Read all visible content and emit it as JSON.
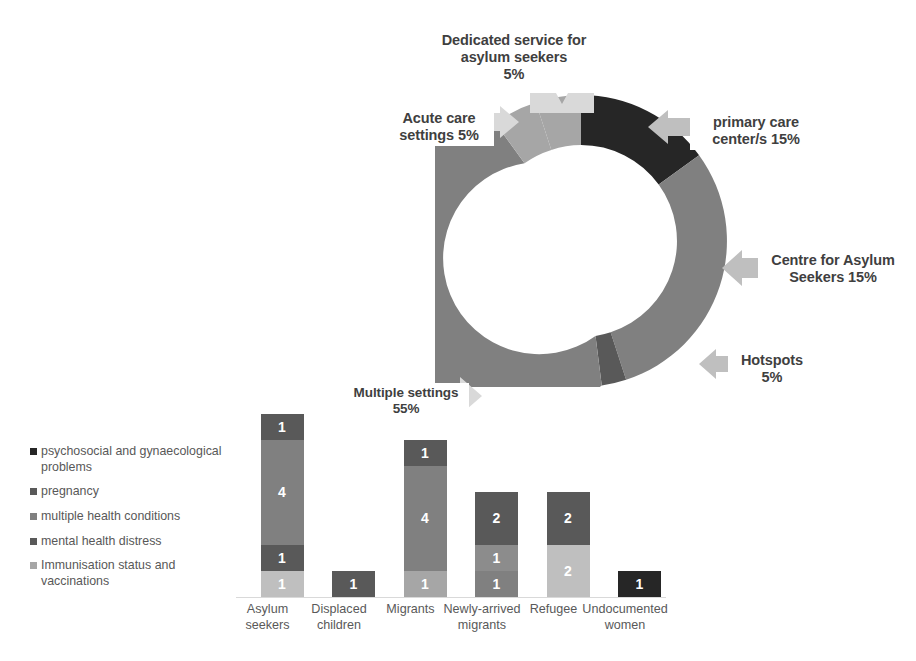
{
  "chart_data": [
    {
      "type": "pie",
      "variant": "doughnut",
      "title": "",
      "legend_position": "none",
      "labels_inline": true,
      "categories": [
        "Dedicated service for asylum seekers",
        "primary care center/s",
        "Centre for Asylum Seekers",
        "Hotspots",
        "Multiple settings",
        "Acute care settings"
      ],
      "values": [
        5,
        15,
        15,
        5,
        55,
        5
      ],
      "value_unit": "%",
      "display_labels": [
        "Dedicated service for asylum seekers 5%",
        "primary care center/s 15%",
        "Centre for Asylum Seekers 15%",
        "Hotspots 5%",
        "Multiple settings 55%",
        "Acute care settings 5%"
      ],
      "colors": [
        "#A6A6A6",
        "#262626",
        "#808080",
        "#595959",
        "#808080",
        "#A6A6A6"
      ]
    },
    {
      "type": "bar",
      "variant": "stacked-column",
      "title": "",
      "xlabel": "",
      "ylabel": "",
      "ylim": [
        0,
        7
      ],
      "grid": false,
      "categories": [
        "Asylum seekers",
        "Displaced children",
        "Migrants",
        "Newly-arrived migrants",
        "Refugee",
        "Undocumented women"
      ],
      "series": [
        {
          "name": "psychosocial and gynaecological problems",
          "color": "#262626",
          "values": [
            0,
            0,
            0,
            0,
            0,
            1
          ]
        },
        {
          "name": "pregnancy",
          "color": "#595959",
          "values": [
            1,
            0,
            1,
            0,
            0,
            0
          ]
        },
        {
          "name": "multiple health conditions",
          "color": "#808080",
          "values": [
            4,
            0,
            4,
            0,
            0,
            0
          ]
        },
        {
          "name": "mental health distress",
          "color": "#595959",
          "values": [
            1,
            1,
            0,
            2,
            2,
            0
          ]
        },
        {
          "name": "Immunisation status and vaccinations",
          "color": "#A6A6A6",
          "values": [
            1,
            0,
            1,
            2,
            2,
            0
          ]
        }
      ],
      "stacks": [
        {
          "category": "Asylum seekers",
          "segments": [
            {
              "label": "1",
              "value": 1,
              "color": "#595959"
            },
            {
              "label": "4",
              "value": 4,
              "color": "#808080"
            },
            {
              "label": "1",
              "value": 1,
              "color": "#595959"
            },
            {
              "label": "1",
              "value": 1,
              "color": "#BFBFBF"
            }
          ]
        },
        {
          "category": "Displaced children",
          "segments": [
            {
              "label": "1",
              "value": 1,
              "color": "#595959"
            }
          ]
        },
        {
          "category": "Migrants",
          "segments": [
            {
              "label": "1",
              "value": 1,
              "color": "#595959"
            },
            {
              "label": "4",
              "value": 4,
              "color": "#808080"
            },
            {
              "label": "1",
              "value": 1,
              "color": "#A6A6A6"
            }
          ]
        },
        {
          "category": "Newly-arrived migrants",
          "segments": [
            {
              "label": "2",
              "value": 2,
              "color": "#595959"
            },
            {
              "label": "1",
              "value": 1,
              "color": "#8C8C8C"
            },
            {
              "label": "1",
              "value": 1,
              "color": "#808080"
            }
          ]
        },
        {
          "category": "Refugee",
          "segments": [
            {
              "label": "2",
              "value": 2,
              "color": "#595959"
            },
            {
              "label": "2",
              "value": 2,
              "color": "#BFBFBF"
            }
          ]
        },
        {
          "category": "Undocumented women",
          "segments": [
            {
              "label": "1",
              "value": 1,
              "color": "#262626"
            }
          ]
        }
      ],
      "legend": [
        {
          "label": "psychosocial and gynaecological problems",
          "color": "#262626"
        },
        {
          "label": "pregnancy",
          "color": "#595959"
        },
        {
          "label": "multiple health conditions",
          "color": "#808080"
        },
        {
          "label": "mental health distress",
          "color": "#595959"
        },
        {
          "label": "Immunisation status and vaccinations",
          "color": "#A6A6A6"
        }
      ]
    }
  ],
  "donut": {
    "callouts": {
      "dedicated": {
        "line1": "Dedicated service for",
        "line2": "asylum seekers",
        "line3": "5%"
      },
      "acute": {
        "line1": "Acute care",
        "line2": "settings 5%"
      },
      "primary": {
        "line1": "primary care",
        "line2": "center/s 15%"
      },
      "centre": {
        "line1": "Centre for Asylum",
        "line2": "Seekers 15%"
      },
      "hotspots": {
        "line1": "Hotspots",
        "line2": "5%"
      },
      "multiple": {
        "line1": "Multiple settings",
        "line2": "55%"
      }
    }
  },
  "legend": {
    "items": [
      {
        "label": "psychosocial and gynaecological problems",
        "color": "#262626"
      },
      {
        "label": "pregnancy",
        "color": "#595959"
      },
      {
        "label": "multiple health conditions",
        "color": "#808080"
      },
      {
        "label": "mental health distress",
        "color": "#595959"
      },
      {
        "label": "Immunisation status and vaccinations",
        "color": "#A6A6A6"
      }
    ]
  },
  "bars": {
    "categories": [
      {
        "line1": "Asylum",
        "line2": "seekers"
      },
      {
        "line1": "Displaced",
        "line2": "children"
      },
      {
        "line1": "Migrants",
        "line2": ""
      },
      {
        "line1": "Newly-arrived",
        "line2": "migrants"
      },
      {
        "line1": "Refugee",
        "line2": ""
      },
      {
        "line1": "Undocumented",
        "line2": "women"
      }
    ]
  }
}
